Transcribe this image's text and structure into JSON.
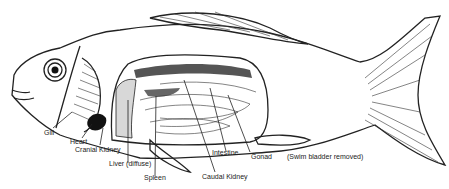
{
  "diagram": {
    "labels": {
      "gill": "Gill",
      "heart": "Heart",
      "cranial_kidney": "Cranial Kidney",
      "liver": "Liver (diffuse)",
      "spleen": "Spleen",
      "caudal_kidney": "Caudal Kidney",
      "intestine": "Intestine",
      "gonad": "Gonad",
      "note": "(Swim bladder removed)"
    },
    "colors": {
      "line": "#222222",
      "organ_dark": "#555555",
      "organ_light": "#d8d8d8",
      "heart": "#111111"
    }
  }
}
